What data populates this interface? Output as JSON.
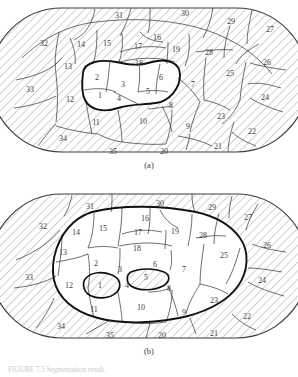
{
  "figure": {
    "panels": [
      {
        "id": "a",
        "label": "(a)",
        "outer_shape": "stadium",
        "hatched": true,
        "inner_contour_note": "small white blob containing regions 1-6",
        "white_regions": [
          "1",
          "2",
          "3",
          "4",
          "5",
          "6"
        ],
        "labels": [
          {
            "text": "31",
            "x": 119,
            "y": 16
          },
          {
            "text": "30",
            "x": 185,
            "y": 14
          },
          {
            "text": "29",
            "x": 231,
            "y": 22
          },
          {
            "text": "27",
            "x": 270,
            "y": 30
          },
          {
            "text": "32",
            "x": 44,
            "y": 44
          },
          {
            "text": "14",
            "x": 81,
            "y": 45
          },
          {
            "text": "15",
            "x": 107,
            "y": 44
          },
          {
            "text": "17",
            "x": 138,
            "y": 47
          },
          {
            "text": "16",
            "x": 157,
            "y": 38
          },
          {
            "text": "19",
            "x": 176,
            "y": 50
          },
          {
            "text": "28",
            "x": 209,
            "y": 53
          },
          {
            "text": "26",
            "x": 267,
            "y": 63
          },
          {
            "text": "13",
            "x": 68,
            "y": 67
          },
          {
            "text": "18",
            "x": 139,
            "y": 64
          },
          {
            "text": "2",
            "x": 97,
            "y": 78
          },
          {
            "text": "3",
            "x": 123,
            "y": 85
          },
          {
            "text": "6",
            "x": 161,
            "y": 78
          },
          {
            "text": "25",
            "x": 230,
            "y": 74
          },
          {
            "text": "33",
            "x": 30,
            "y": 90
          },
          {
            "text": "12",
            "x": 70,
            "y": 100
          },
          {
            "text": "4",
            "x": 104,
            "y": 95
          },
          {
            "text": "5",
            "x": 148,
            "y": 92
          },
          {
            "text": "7",
            "x": 193,
            "y": 85
          },
          {
            "text": "24",
            "x": 265,
            "y": 98
          },
          {
            "text": "1",
            "x": 100,
            "y": 96
          },
          {
            "text": "8",
            "x": 171,
            "y": 106
          },
          {
            "text": "11",
            "x": 96,
            "y": 123
          },
          {
            "text": "10",
            "x": 143,
            "y": 122
          },
          {
            "text": "9",
            "x": 188,
            "y": 127
          },
          {
            "text": "23",
            "x": 221,
            "y": 117
          },
          {
            "text": "22",
            "x": 252,
            "y": 132
          },
          {
            "text": "34",
            "x": 63,
            "y": 139
          },
          {
            "text": "35",
            "x": 113,
            "y": 152
          },
          {
            "text": "20",
            "x": 164,
            "y": 152
          },
          {
            "text": "21",
            "x": 218,
            "y": 147
          }
        ]
      },
      {
        "id": "b",
        "label": "(b)",
        "outer_shape": "stadium",
        "hatched": true,
        "inner_contour_note": "large white region containing 2-4,6-19 with hatched islands at 1 and 5",
        "white_regions": [
          "2",
          "3",
          "4",
          "6",
          "7",
          "8",
          "9",
          "10",
          "11",
          "12",
          "13",
          "14",
          "15",
          "16",
          "17",
          "18",
          "19",
          "20",
          "23",
          "25",
          "28"
        ],
        "hatched_islands": [
          "1",
          "5"
        ],
        "labels": [
          {
            "text": "31",
            "x": 90,
            "y": 21
          },
          {
            "text": "30",
            "x": 160,
            "y": 18
          },
          {
            "text": "29",
            "x": 212,
            "y": 22
          },
          {
            "text": "27",
            "x": 248,
            "y": 32
          },
          {
            "text": "32",
            "x": 43,
            "y": 41
          },
          {
            "text": "16",
            "x": 145,
            "y": 33
          },
          {
            "text": "14",
            "x": 76,
            "y": 47
          },
          {
            "text": "15",
            "x": 103,
            "y": 43
          },
          {
            "text": "17",
            "x": 138,
            "y": 47
          },
          {
            "text": "19",
            "x": 175,
            "y": 46
          },
          {
            "text": "28",
            "x": 203,
            "y": 50
          },
          {
            "text": "26",
            "x": 267,
            "y": 60
          },
          {
            "text": "13",
            "x": 63,
            "y": 67
          },
          {
            "text": "18",
            "x": 137,
            "y": 63
          },
          {
            "text": "25",
            "x": 224,
            "y": 70
          },
          {
            "text": "2",
            "x": 96,
            "y": 78
          },
          {
            "text": "3",
            "x": 120,
            "y": 84
          },
          {
            "text": "6",
            "x": 155,
            "y": 79
          },
          {
            "text": "7",
            "x": 184,
            "y": 84
          },
          {
            "text": "33",
            "x": 29,
            "y": 92
          },
          {
            "text": "12",
            "x": 69,
            "y": 100
          },
          {
            "text": "1",
            "x": 100,
            "y": 100
          },
          {
            "text": "4",
            "x": 127,
            "y": 100
          },
          {
            "text": "5",
            "x": 146,
            "y": 92
          },
          {
            "text": "8",
            "x": 169,
            "y": 103
          },
          {
            "text": "24",
            "x": 262,
            "y": 95
          },
          {
            "text": "23",
            "x": 214,
            "y": 115
          },
          {
            "text": "11",
            "x": 94,
            "y": 124
          },
          {
            "text": "10",
            "x": 141,
            "y": 122
          },
          {
            "text": "9",
            "x": 184,
            "y": 127
          },
          {
            "text": "22",
            "x": 247,
            "y": 131
          },
          {
            "text": "34",
            "x": 61,
            "y": 141
          },
          {
            "text": "35",
            "x": 110,
            "y": 150
          },
          {
            "text": "20",
            "x": 162,
            "y": 150
          },
          {
            "text": "21",
            "x": 214,
            "y": 148
          }
        ]
      }
    ],
    "caption": "FIGURE 7.5  Segmentation result."
  },
  "colors": {
    "line": "#3d3d3d",
    "thick_contour": "#111111",
    "hatch": "#9a9a9a",
    "background": "#ffffff",
    "text": "#3d3d3d"
  }
}
